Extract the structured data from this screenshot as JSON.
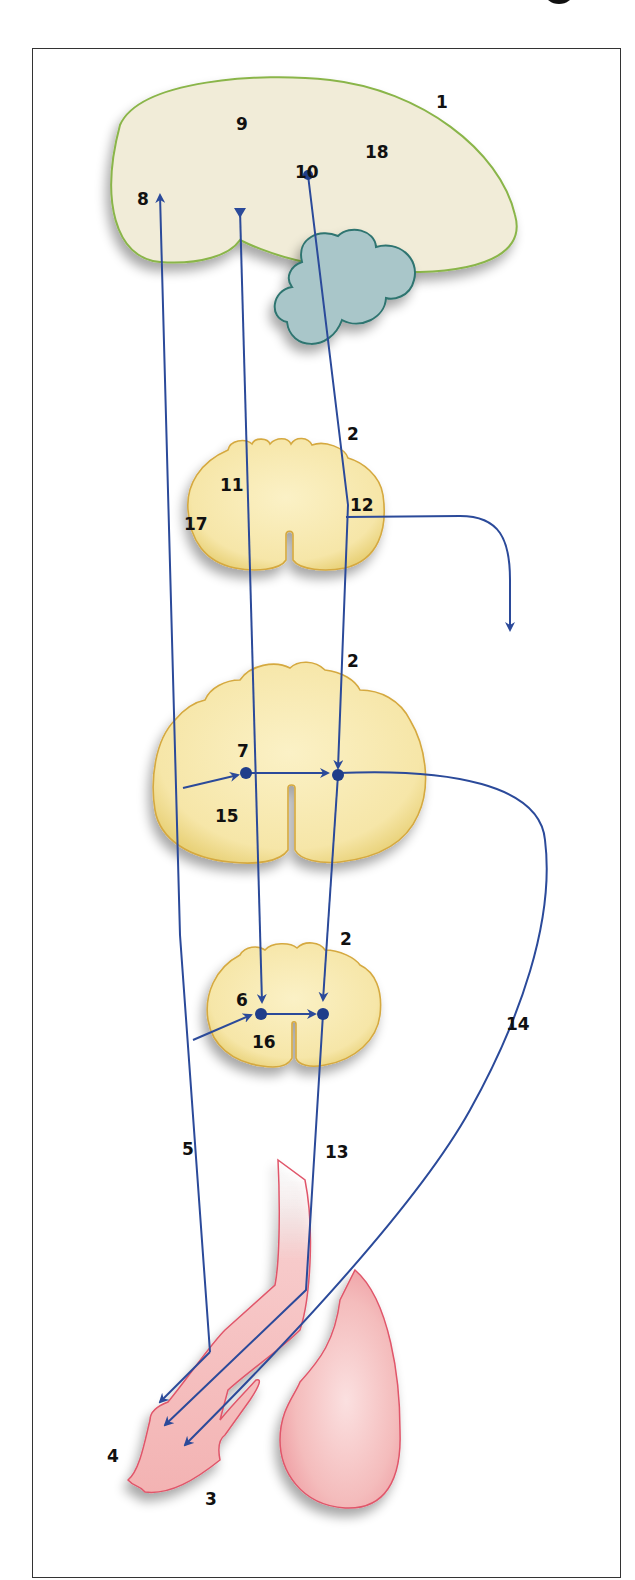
{
  "colors": {
    "brain_fill": "#f1ecd8",
    "brain_stroke": "#8ab54a",
    "cerebellum_fill": "#a9c6c9",
    "cerebellum_stroke": "#2f7470",
    "cord_fill": "#f7e9b2",
    "cord_stroke": "#d5a940",
    "organ_fill": "#f4b8b8",
    "organ_stroke": "#e0566a",
    "pathway": "#2b4a9a"
  },
  "labels": {
    "l1": "1",
    "l2a": "2",
    "l2b": "2",
    "l2c": "2",
    "l3": "3",
    "l4": "4",
    "l5": "5",
    "l6": "6",
    "l7": "7",
    "l8": "8",
    "l9": "9",
    "l10": "10",
    "l11": "11",
    "l12": "12",
    "l13": "13",
    "l14": "14",
    "l15": "15",
    "l16": "16",
    "l17": "17",
    "l18": "18"
  }
}
